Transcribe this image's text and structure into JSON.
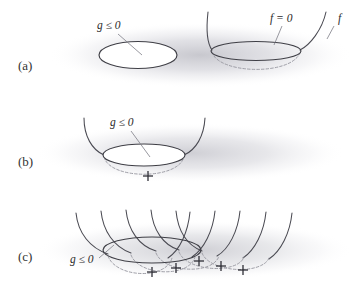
{
  "figure": {
    "background_color": "#ffffff",
    "ink_color": "#3f3f46",
    "hidden_line_color": "#9a9aa2",
    "shadow_color": "#c9c9cf",
    "width": 353,
    "height": 299
  },
  "panels": [
    {
      "id": "a",
      "label": "(a)",
      "label_x": 22,
      "label_y": 68,
      "description": "Feasible region ellipse and objective bowl shown separately",
      "annotations": [
        {
          "name": "constraint-label",
          "text": "g ≤ 0",
          "x": 97,
          "y": 29,
          "leader_from_x": 118,
          "leader_from_y": 34,
          "leader_to_x": 142,
          "leader_to_y": 55
        },
        {
          "name": "level-set-label",
          "text": "f = 0",
          "x": 272,
          "y": 22,
          "leader_from_x": 282,
          "leader_from_y": 26,
          "leader_to_x": 274,
          "leader_to_y": 45
        },
        {
          "name": "objective-label",
          "text": "f",
          "x": 339,
          "y": 22,
          "leader_from_x": 332,
          "leader_from_y": 26,
          "leader_to_x": 326,
          "leader_to_y": 38
        }
      ],
      "minimizer_marks": [
        {
          "name": "unconstrained-minimizer",
          "x": 256,
          "y": 73
        }
      ]
    },
    {
      "id": "b",
      "label": "(b)",
      "label_x": 22,
      "label_y": 163,
      "description": "Bowl placed so its minimum lies inside the feasible ellipse",
      "annotations": [
        {
          "name": "constraint-label",
          "text": "g ≤ 0",
          "x": 112,
          "y": 126,
          "leader_from_x": 131,
          "leader_from_y": 131,
          "leader_to_x": 150,
          "leader_to_y": 157
        }
      ],
      "minimizer_marks": [
        {
          "name": "unconstrained-minimizer",
          "x": 148,
          "y": 176
        }
      ]
    },
    {
      "id": "c",
      "label": "(c)",
      "label_x": 22,
      "label_y": 258,
      "description": "Family of translated bowls sweeping their minima across the feasible set",
      "annotations": [
        {
          "name": "constraint-label",
          "text": "g ≤ 0",
          "x": 73,
          "y": 262,
          "leader_from_x": 96,
          "leader_from_y": 258,
          "leader_to_x": 112,
          "leader_to_y": 243
        }
      ],
      "minimizer_marks": [
        {
          "name": "minimizer-1",
          "x": 152,
          "y": 272
        },
        {
          "name": "minimizer-2",
          "x": 176,
          "y": 268
        },
        {
          "name": "minimizer-3",
          "x": 199,
          "y": 261
        },
        {
          "name": "minimizer-4",
          "x": 221,
          "y": 266
        },
        {
          "name": "minimizer-5",
          "x": 243,
          "y": 270
        }
      ],
      "bowl_count": 5
    }
  ],
  "symbols": {
    "constraint": "g ≤ 0",
    "level_set": "f = 0",
    "objective": "f",
    "minimizer_glyph": "+"
  }
}
